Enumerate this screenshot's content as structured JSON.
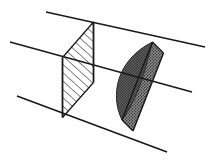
{
  "figure": {
    "title": "Two cross-sectional planes intersecting a bundle of parallel lines",
    "type": "line-art-geometric-diagram",
    "width": 213,
    "height": 161,
    "background_color": "#ffffff",
    "stroke_color": "#1a1a1a",
    "hatch_color": "#2b2b2b",
    "stipple_color": "#3c3c3c",
    "stipple_fill_color": "#6e6e6e"
  },
  "parallel_lines": {
    "label": "bundle of parallel lines",
    "count": 3,
    "stroke_width": 1.6,
    "segments": [
      {
        "name": "upper-parallel-line",
        "x1": 46,
        "y1": 12,
        "x2": 205,
        "y2": 47
      },
      {
        "name": "middle-parallel-line",
        "x1": 10,
        "y1": 42,
        "x2": 192,
        "y2": 92
      },
      {
        "name": "lower-parallel-line",
        "x1": 17,
        "y1": 96,
        "x2": 167,
        "y2": 152
      }
    ]
  },
  "hatched_plane": {
    "label": "hatched cross-section",
    "fill_pattern": "diagonal-hatch",
    "vertices": [
      {
        "x": 62.5,
        "y": 57.5
      },
      {
        "x": 93.5,
        "y": 22.0
      },
      {
        "x": 93.5,
        "y": 82.5
      },
      {
        "x": 62.5,
        "y": 117.5
      }
    ],
    "hatch_spacing": 4.6,
    "hatch_angle_deg": 42
  },
  "stippled_plane": {
    "label": "stippled cross-section",
    "fill_pattern": "stipple-dots",
    "vertices": [
      {
        "x": 122.0,
        "y": 120.0
      },
      {
        "x": 152.5,
        "y": 42.0
      },
      {
        "x": 163.5,
        "y": 53.0
      },
      {
        "x": 133.0,
        "y": 131.0
      }
    ],
    "lens": {
      "label": "lens-shaped inner region",
      "apex_top": {
        "x": 152.5,
        "y": 42.0
      },
      "apex_bottom": {
        "x": 122.0,
        "y": 120.0
      },
      "bulge_left": {
        "x": 116.0,
        "y": 78.0
      },
      "bulge_right": {
        "x": 146.0,
        "y": 86.0
      }
    }
  },
  "edges": {
    "label": "solid outline edges",
    "hatched_left_edge": {
      "x1": 62.5,
      "y1": 57.5,
      "x2": 62.5,
      "y2": 117.5
    },
    "hatched_right_edge": {
      "x1": 93.5,
      "y1": 22.0,
      "x2": 93.5,
      "y2": 82.5
    },
    "stippled_left_edge": {
      "x1": 122.0,
      "y1": 120.0,
      "x2": 152.5,
      "y2": 42.0
    },
    "stippled_right_edge": {
      "x1": 133.0,
      "y1": 131.0,
      "x2": 163.5,
      "y2": 53.0
    }
  }
}
